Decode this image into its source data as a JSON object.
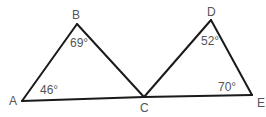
{
  "diagram": {
    "type": "geometry-triangles",
    "colors": {
      "line": "#1a1a1a",
      "text": "#555555",
      "background": "#ffffff"
    },
    "vertices": {
      "A": {
        "label": "A",
        "x": 22,
        "y": 101
      },
      "B": {
        "label": "B",
        "x": 77,
        "y": 24
      },
      "C": {
        "label": "C",
        "x": 144,
        "y": 97
      },
      "D": {
        "label": "D",
        "x": 211,
        "y": 20
      },
      "E": {
        "label": "E",
        "x": 252,
        "y": 95
      }
    },
    "segments": [
      "AB",
      "BC",
      "AC",
      "CD",
      "DE",
      "CE"
    ],
    "angles": {
      "B": {
        "vertex": "B",
        "value": "69°"
      },
      "A": {
        "vertex": "A",
        "value": "46°"
      },
      "D": {
        "vertex": "D",
        "value": "52°"
      },
      "E": {
        "vertex": "E",
        "value": "70°"
      }
    }
  }
}
